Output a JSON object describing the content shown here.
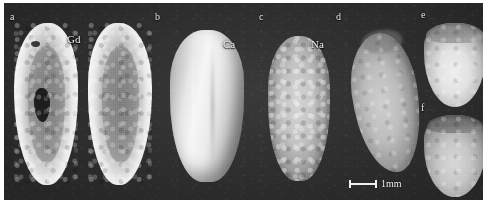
{
  "figure": {
    "type": "multi-panel grayscale imaging figure",
    "background_color": "#2c2c2c",
    "panel_count": 6,
    "panels": [
      {
        "id": "a",
        "label": "a",
        "element_label": "Gd",
        "description": "two sectioned halves with bright outer rim and mottled darker core containing a dark void"
      },
      {
        "id": "b",
        "label": "b",
        "element_label": "Ca",
        "description": "smooth bright whole specimen, 3D rendered surface with longitudinal ridge"
      },
      {
        "id": "c",
        "label": "c",
        "element_label": "Na",
        "description": "grainy mottled ovoid specimen"
      },
      {
        "id": "d",
        "label": "d",
        "element_label": "",
        "description": "tilted grainy teardrop-shaped specimen"
      },
      {
        "id": "e",
        "label": "e",
        "element_label": "",
        "description": "cut half specimen with flat sectioned face, upper right"
      },
      {
        "id": "f",
        "label": "f",
        "element_label": "",
        "description": "cut half specimen with flat sectioned face, lower right"
      }
    ],
    "element_labels": [
      {
        "symbol": "Gd",
        "name": "gadolinium"
      },
      {
        "symbol": "Ca",
        "name": "calcium"
      },
      {
        "symbol": "Na",
        "name": "sodium"
      }
    ],
    "scale_bar": {
      "length_label": "1mm",
      "position": "below panel d"
    },
    "label_color": "#e8e8e8"
  }
}
